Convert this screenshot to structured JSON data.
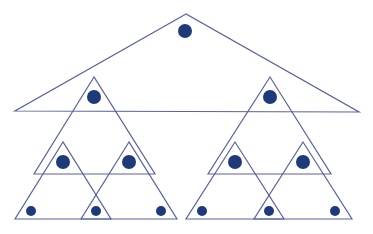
{
  "diagram": {
    "title": "",
    "stroke_color": "#5a62a0",
    "dot_color": "#1f3a7a",
    "triangles": [
      {
        "id": "root",
        "points": [
          [
            186,
            14
          ],
          [
            15,
            111
          ],
          [
            359,
            112
          ]
        ]
      },
      {
        "id": "level2-left",
        "points": [
          [
            94,
            77
          ],
          [
            34,
            174
          ],
          [
            155,
            174
          ]
        ]
      },
      {
        "id": "level2-right",
        "points": [
          [
            270,
            77
          ],
          [
            208,
            174
          ],
          [
            331,
            174
          ]
        ]
      },
      {
        "id": "level3-left-a",
        "points": [
          [
            63,
            142
          ],
          [
            15,
            219
          ],
          [
            111,
            219
          ]
        ]
      },
      {
        "id": "level3-left-b",
        "points": [
          [
            129,
            142
          ],
          [
            81,
            219
          ],
          [
            177,
            219
          ]
        ]
      },
      {
        "id": "level3-right-a",
        "points": [
          [
            235,
            142
          ],
          [
            186,
            219
          ],
          [
            284,
            219
          ]
        ]
      },
      {
        "id": "level3-right-b",
        "points": [
          [
            303,
            142
          ],
          [
            254,
            219
          ],
          [
            352,
            219
          ]
        ]
      }
    ],
    "dots": [
      {
        "id": "root-node",
        "cx": 185,
        "cy": 31,
        "r": 7
      },
      {
        "id": "level2-left-node",
        "cx": 94,
        "cy": 97,
        "r": 7
      },
      {
        "id": "level2-right-node",
        "cx": 270,
        "cy": 97,
        "r": 7
      },
      {
        "id": "level3-left-a-node",
        "cx": 63,
        "cy": 162,
        "r": 7
      },
      {
        "id": "level3-left-b-node",
        "cx": 129,
        "cy": 162,
        "r": 7
      },
      {
        "id": "level3-right-a-node",
        "cx": 235,
        "cy": 162,
        "r": 7
      },
      {
        "id": "level3-right-b-node",
        "cx": 303,
        "cy": 162,
        "r": 7
      },
      {
        "id": "leaf-1",
        "cx": 31,
        "cy": 211,
        "r": 5
      },
      {
        "id": "leaf-2",
        "cx": 96,
        "cy": 211,
        "r": 5
      },
      {
        "id": "leaf-3",
        "cx": 161,
        "cy": 211,
        "r": 5
      },
      {
        "id": "leaf-4",
        "cx": 202,
        "cy": 211,
        "r": 5
      },
      {
        "id": "leaf-5",
        "cx": 269,
        "cy": 211,
        "r": 5
      },
      {
        "id": "leaf-6",
        "cx": 335,
        "cy": 211,
        "r": 5
      }
    ]
  }
}
